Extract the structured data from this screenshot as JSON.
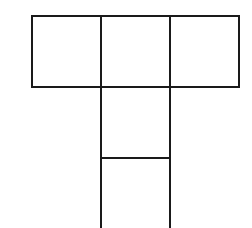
{
  "diagram": {
    "type": "net-of-squares",
    "shape": "T",
    "line_color": "#1a1a1a",
    "squares": [
      {
        "id": "top-left",
        "row": 0,
        "col": 0
      },
      {
        "id": "top-center",
        "row": 0,
        "col": 1
      },
      {
        "id": "top-right",
        "row": 0,
        "col": 2
      },
      {
        "id": "middle",
        "row": 1,
        "col": 1
      },
      {
        "id": "bottom",
        "row": 2,
        "col": 1
      }
    ]
  }
}
